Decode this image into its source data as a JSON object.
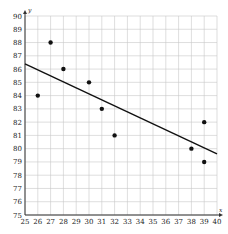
{
  "chart_data": {
    "type": "scatter",
    "title": "",
    "xlabel": "x",
    "ylabel": "y",
    "xlim": [
      25,
      40
    ],
    "ylim": [
      75,
      90
    ],
    "grid": true,
    "x_ticks": [
      "25",
      "26",
      "27",
      "28",
      "29",
      "30",
      "31",
      "32",
      "33",
      "34",
      "35",
      "36",
      "37",
      "38",
      "39",
      "40"
    ],
    "y_ticks": [
      "75",
      "76",
      "77",
      "78",
      "79",
      "80",
      "81",
      "82",
      "83",
      "84",
      "85",
      "86",
      "87",
      "88",
      "89",
      "90"
    ],
    "series": [
      {
        "name": "data",
        "points": [
          {
            "x": 26,
            "y": 84
          },
          {
            "x": 27,
            "y": 88
          },
          {
            "x": 28,
            "y": 86
          },
          {
            "x": 30,
            "y": 85
          },
          {
            "x": 31,
            "y": 83
          },
          {
            "x": 32,
            "y": 81
          },
          {
            "x": 38,
            "y": 80
          },
          {
            "x": 39,
            "y": 82
          },
          {
            "x": 39,
            "y": 79
          }
        ]
      }
    ],
    "trend_line": {
      "x1": 25,
      "y1": 86.4,
      "x2": 40,
      "y2": 79.6
    },
    "colors": {
      "grid": "#c8c8c8",
      "axis": "#333333",
      "points": "#111111",
      "line": "#111111"
    }
  }
}
